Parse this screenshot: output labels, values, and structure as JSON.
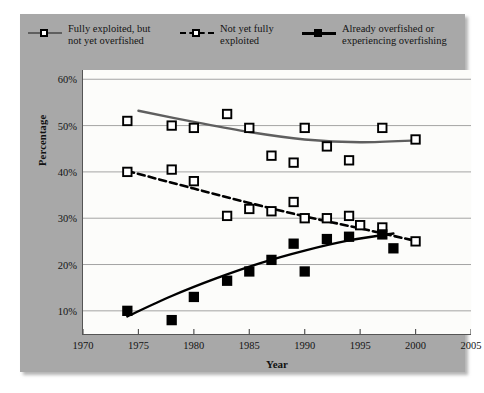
{
  "legend": {
    "items": [
      {
        "label_line1": "Fully exploited, but",
        "label_line2": "not yet overfished",
        "marker": "open-square",
        "line": "solid-gray",
        "color": "#5f5f5f"
      },
      {
        "label_line1": "Not yet fully",
        "label_line2": "exploited",
        "marker": "open-square",
        "line": "dashed-black",
        "color": "#000000"
      },
      {
        "label_line1": "Already overfished or",
        "label_line2": "experiencing overfishing",
        "marker": "filled-square",
        "line": "solid-black",
        "color": "#000000"
      }
    ]
  },
  "chart_data": {
    "type": "scatter",
    "title": "",
    "xlabel": "Year",
    "ylabel": "Percentage",
    "xlim": [
      1970,
      2005
    ],
    "ylim": [
      5,
      62
    ],
    "xticks": [
      1970,
      1975,
      1980,
      1985,
      1990,
      1995,
      2000,
      2005
    ],
    "xtick_labels": [
      "1970",
      "1975",
      "1980",
      "1985",
      "1990",
      "1995",
      "2000",
      "2005"
    ],
    "yticks": [
      10,
      20,
      30,
      40,
      50,
      60
    ],
    "ytick_labels": [
      "10%",
      "20%",
      "30%",
      "40%",
      "50%",
      "60%"
    ],
    "grid": "horizontal",
    "legend_position": "top",
    "series": [
      {
        "name": "Fully exploited, but not yet overfished",
        "marker": "open-square",
        "line": "solid-gray",
        "color": "#5f5f5f",
        "points": [
          {
            "x": 1974,
            "y": 51
          },
          {
            "x": 1978,
            "y": 50
          },
          {
            "x": 1980,
            "y": 49.5
          },
          {
            "x": 1983,
            "y": 52.5
          },
          {
            "x": 1985,
            "y": 49.5
          },
          {
            "x": 1987,
            "y": 43.5
          },
          {
            "x": 1989,
            "y": 42
          },
          {
            "x": 1990,
            "y": 49.5
          },
          {
            "x": 1992,
            "y": 45.5
          },
          {
            "x": 1994,
            "y": 42.5
          },
          {
            "x": 1997,
            "y": 49.5
          },
          {
            "x": 2000,
            "y": 47
          }
        ],
        "trend": [
          {
            "x": 1975,
            "y": 53.2
          },
          {
            "x": 1980,
            "y": 50.8
          },
          {
            "x": 1985,
            "y": 48.6
          },
          {
            "x": 1990,
            "y": 47.0
          },
          {
            "x": 1995,
            "y": 46.4
          },
          {
            "x": 2000,
            "y": 46.8
          }
        ]
      },
      {
        "name": "Not yet fully exploited",
        "marker": "open-square",
        "line": "dashed-black",
        "color": "#000000",
        "points": [
          {
            "x": 1974,
            "y": 40
          },
          {
            "x": 1978,
            "y": 40.5
          },
          {
            "x": 1980,
            "y": 38
          },
          {
            "x": 1983,
            "y": 30.5
          },
          {
            "x": 1985,
            "y": 32
          },
          {
            "x": 1987,
            "y": 31.5
          },
          {
            "x": 1989,
            "y": 33.5
          },
          {
            "x": 1990,
            "y": 30
          },
          {
            "x": 1992,
            "y": 30
          },
          {
            "x": 1994,
            "y": 30.5
          },
          {
            "x": 1995,
            "y": 28.5
          },
          {
            "x": 1997,
            "y": 28
          },
          {
            "x": 2000,
            "y": 25
          }
        ],
        "trend": [
          {
            "x": 1974,
            "y": 40.2
          },
          {
            "x": 1980,
            "y": 36.4
          },
          {
            "x": 1985,
            "y": 33.3
          },
          {
            "x": 1990,
            "y": 30.4
          },
          {
            "x": 1995,
            "y": 27.8
          },
          {
            "x": 2000,
            "y": 25.1
          }
        ]
      },
      {
        "name": "Already overfished or experiencing overfishing",
        "marker": "filled-square",
        "line": "solid-black",
        "color": "#000000",
        "points": [
          {
            "x": 1974,
            "y": 10
          },
          {
            "x": 1978,
            "y": 8
          },
          {
            "x": 1980,
            "y": 13
          },
          {
            "x": 1983,
            "y": 16.5
          },
          {
            "x": 1985,
            "y": 18.5
          },
          {
            "x": 1987,
            "y": 21
          },
          {
            "x": 1989,
            "y": 24.5
          },
          {
            "x": 1990,
            "y": 18.5
          },
          {
            "x": 1992,
            "y": 25.5
          },
          {
            "x": 1994,
            "y": 26
          },
          {
            "x": 1997,
            "y": 26.5
          },
          {
            "x": 1998,
            "y": 23.5
          }
        ],
        "trend": [
          {
            "x": 1974,
            "y": 8.8
          },
          {
            "x": 1978,
            "y": 13.2
          },
          {
            "x": 1982,
            "y": 17.0
          },
          {
            "x": 1986,
            "y": 20.3
          },
          {
            "x": 1990,
            "y": 23.0
          },
          {
            "x": 1994,
            "y": 25.2
          },
          {
            "x": 1998,
            "y": 26.7
          }
        ]
      }
    ]
  }
}
